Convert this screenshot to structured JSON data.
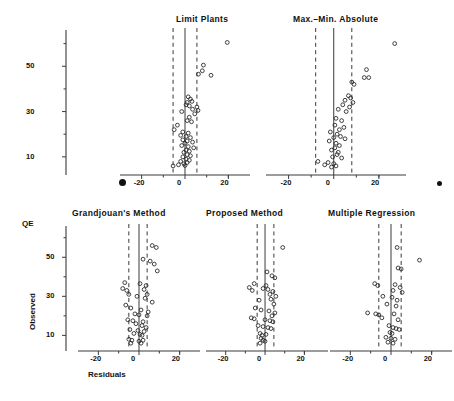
{
  "figure": {
    "axis_labels": {
      "y_top_line1": "QE",
      "y_rotated": "Observed",
      "x_label": "Residuals"
    },
    "y_axis_top": {
      "ticklabels": [
        "50",
        "30",
        "10"
      ],
      "tickvalues": [
        50,
        30,
        10
      ],
      "minor_ticks": [
        60,
        40,
        20
      ]
    },
    "y_axis_bottom": {
      "ticklabels": [
        "50",
        "30",
        "10"
      ],
      "tickvalues": [
        50,
        30,
        10
      ],
      "minor_ticks": [
        60,
        40,
        20
      ]
    },
    "marker_dot_left": "page-marker-dot",
    "marker_dot_right": "page-marker-dot"
  },
  "chart_data": [
    {
      "type": "scatter",
      "title": "Limit  Plants",
      "xlabel": "",
      "ylabel": "",
      "xlim": [
        -30,
        30
      ],
      "ylim": [
        2,
        66
      ],
      "xticks": [
        -20,
        0,
        20
      ],
      "xticklabels": [
        "-20",
        "0",
        "20"
      ],
      "grid": false,
      "reference_lines": {
        "solid": 0,
        "dashed": [
          -5.5,
          5.5
        ]
      },
      "points": [
        {
          "x": 19.5,
          "y": 60.5
        },
        {
          "x": 8.5,
          "y": 50.5
        },
        {
          "x": 8.0,
          "y": 48.0
        },
        {
          "x": 6.2,
          "y": 46.5
        },
        {
          "x": 12.0,
          "y": 46.0
        },
        {
          "x": 1.5,
          "y": 36.5
        },
        {
          "x": 2.5,
          "y": 35.5
        },
        {
          "x": 3.2,
          "y": 34.5
        },
        {
          "x": 1.0,
          "y": 34.0
        },
        {
          "x": 0.5,
          "y": 33.0
        },
        {
          "x": 2.0,
          "y": 32.5
        },
        {
          "x": 5.5,
          "y": 32.0
        },
        {
          "x": 3.5,
          "y": 31.0
        },
        {
          "x": 6.0,
          "y": 30.5
        },
        {
          "x": -1.5,
          "y": 30.0
        },
        {
          "x": 4.5,
          "y": 29.0
        },
        {
          "x": 2.0,
          "y": 27.5
        },
        {
          "x": 1.0,
          "y": 26.0
        },
        {
          "x": 3.0,
          "y": 25.5
        },
        {
          "x": -3.5,
          "y": 24.0
        },
        {
          "x": -5.0,
          "y": 22.0
        },
        {
          "x": -1.0,
          "y": 21.0
        },
        {
          "x": 1.5,
          "y": 20.5
        },
        {
          "x": -2.0,
          "y": 19.5
        },
        {
          "x": 0.5,
          "y": 19.0
        },
        {
          "x": 2.5,
          "y": 18.5
        },
        {
          "x": -1.0,
          "y": 17.5
        },
        {
          "x": 1.0,
          "y": 17.0
        },
        {
          "x": 3.5,
          "y": 16.5
        },
        {
          "x": 0.0,
          "y": 16.0
        },
        {
          "x": -1.5,
          "y": 15.0
        },
        {
          "x": 1.5,
          "y": 14.5
        },
        {
          "x": 4.0,
          "y": 14.0
        },
        {
          "x": 0.5,
          "y": 13.0
        },
        {
          "x": 2.0,
          "y": 12.5
        },
        {
          "x": -0.5,
          "y": 12.0
        },
        {
          "x": 1.0,
          "y": 11.0
        },
        {
          "x": 2.5,
          "y": 10.5
        },
        {
          "x": -1.0,
          "y": 10.0
        },
        {
          "x": 0.5,
          "y": 9.0
        },
        {
          "x": 2.0,
          "y": 8.5
        },
        {
          "x": -2.0,
          "y": 8.0
        },
        {
          "x": 1.0,
          "y": 7.5
        },
        {
          "x": -0.5,
          "y": 7.0
        },
        {
          "x": -5.5,
          "y": 6.0
        },
        {
          "x": -3.0,
          "y": 6.5
        },
        {
          "x": 0.0,
          "y": 6.2
        }
      ]
    },
    {
      "type": "scatter",
      "title": "Max.–Min. Absolute",
      "xlabel": "",
      "ylabel": "",
      "xlim": [
        -30,
        32
      ],
      "ylim": [
        2,
        66
      ],
      "xticks": [
        -20,
        0,
        20
      ],
      "xticklabels": [
        "-20",
        "0",
        "20"
      ],
      "grid": false,
      "reference_lines": {
        "solid": 0,
        "dashed": [
          -8.0,
          8.0
        ]
      },
      "points": [
        {
          "x": 27.0,
          "y": 60.0
        },
        {
          "x": 14.5,
          "y": 48.5
        },
        {
          "x": 13.5,
          "y": 45.0
        },
        {
          "x": 15.5,
          "y": 45.0
        },
        {
          "x": 8.0,
          "y": 43.0
        },
        {
          "x": 9.0,
          "y": 42.0
        },
        {
          "x": 6.5,
          "y": 37.0
        },
        {
          "x": 7.5,
          "y": 36.0
        },
        {
          "x": 5.0,
          "y": 35.0
        },
        {
          "x": 8.5,
          "y": 34.0
        },
        {
          "x": 4.0,
          "y": 33.0
        },
        {
          "x": 7.0,
          "y": 32.0
        },
        {
          "x": 2.0,
          "y": 31.0
        },
        {
          "x": 5.5,
          "y": 30.0
        },
        {
          "x": 1.0,
          "y": 27.0
        },
        {
          "x": 3.5,
          "y": 26.0
        },
        {
          "x": 0.5,
          "y": 24.0
        },
        {
          "x": 4.5,
          "y": 23.0
        },
        {
          "x": 2.5,
          "y": 22.0
        },
        {
          "x": -1.5,
          "y": 21.0
        },
        {
          "x": 1.5,
          "y": 20.0
        },
        {
          "x": 3.0,
          "y": 19.0
        },
        {
          "x": 0.0,
          "y": 18.5
        },
        {
          "x": 5.0,
          "y": 18.0
        },
        {
          "x": -2.0,
          "y": 17.0
        },
        {
          "x": 1.0,
          "y": 16.0
        },
        {
          "x": 2.5,
          "y": 15.0
        },
        {
          "x": 0.5,
          "y": 14.0
        },
        {
          "x": -1.0,
          "y": 13.0
        },
        {
          "x": 2.0,
          "y": 12.0
        },
        {
          "x": 1.5,
          "y": 11.0
        },
        {
          "x": -0.5,
          "y": 10.0
        },
        {
          "x": 3.5,
          "y": 9.5
        },
        {
          "x": -7.0,
          "y": 8.0
        },
        {
          "x": -2.5,
          "y": 7.5
        },
        {
          "x": 0.0,
          "y": 7.0
        },
        {
          "x": -4.0,
          "y": 6.5
        },
        {
          "x": 1.0,
          "y": 6.0
        },
        {
          "x": -1.0,
          "y": 5.5
        }
      ]
    },
    {
      "type": "scatter",
      "title": "Grandjouan's  Method",
      "xlabel": "Residuals",
      "ylabel": "QE Observed",
      "xlim": [
        -30,
        30
      ],
      "ylim": [
        2,
        66
      ],
      "xticks": [
        -20,
        0,
        20
      ],
      "xticklabels": [
        "-20",
        "0",
        "20"
      ],
      "grid": false,
      "reference_lines": {
        "solid": 0,
        "dashed": [
          -5.0,
          4.0
        ]
      },
      "points": [
        {
          "x": 6.5,
          "y": 56.0
        },
        {
          "x": 8.5,
          "y": 55.0
        },
        {
          "x": 2.0,
          "y": 49.0
        },
        {
          "x": 5.5,
          "y": 48.0
        },
        {
          "x": 7.5,
          "y": 46.5
        },
        {
          "x": 9.0,
          "y": 43.0
        },
        {
          "x": -7.0,
          "y": 37.0
        },
        {
          "x": 0.5,
          "y": 36.5
        },
        {
          "x": 3.5,
          "y": 35.5
        },
        {
          "x": -8.0,
          "y": 34.0
        },
        {
          "x": -6.0,
          "y": 33.0
        },
        {
          "x": 2.5,
          "y": 33.5
        },
        {
          "x": -5.0,
          "y": 31.0
        },
        {
          "x": 4.0,
          "y": 31.0
        },
        {
          "x": -1.0,
          "y": 30.0
        },
        {
          "x": 3.0,
          "y": 29.0
        },
        {
          "x": 6.5,
          "y": 27.0
        },
        {
          "x": -6.5,
          "y": 25.5
        },
        {
          "x": -4.0,
          "y": 24.0
        },
        {
          "x": 1.0,
          "y": 23.0
        },
        {
          "x": 4.5,
          "y": 22.0
        },
        {
          "x": -2.0,
          "y": 21.0
        },
        {
          "x": 0.0,
          "y": 20.5
        },
        {
          "x": 4.0,
          "y": 20.0
        },
        {
          "x": -5.5,
          "y": 18.0
        },
        {
          "x": -3.0,
          "y": 17.5
        },
        {
          "x": 2.0,
          "y": 17.0
        },
        {
          "x": -1.5,
          "y": 16.0
        },
        {
          "x": 1.5,
          "y": 15.0
        },
        {
          "x": 3.5,
          "y": 14.0
        },
        {
          "x": -4.5,
          "y": 13.0
        },
        {
          "x": -0.5,
          "y": 12.5
        },
        {
          "x": 2.5,
          "y": 12.0
        },
        {
          "x": -2.5,
          "y": 11.0
        },
        {
          "x": 0.5,
          "y": 10.5
        },
        {
          "x": 1.5,
          "y": 10.0
        },
        {
          "x": -5.0,
          "y": 8.0
        },
        {
          "x": -3.5,
          "y": 7.5
        },
        {
          "x": 0.0,
          "y": 7.0
        },
        {
          "x": 2.0,
          "y": 7.5
        },
        {
          "x": -4.0,
          "y": 6.0
        },
        {
          "x": 1.0,
          "y": 6.0
        }
      ]
    },
    {
      "type": "scatter",
      "title": "Proposed  Method",
      "xlabel": "",
      "ylabel": "",
      "xlim": [
        -30,
        32
      ],
      "ylim": [
        2,
        66
      ],
      "xticks": [
        -20,
        0,
        20
      ],
      "xticklabels": [
        "-20",
        "0",
        "20"
      ],
      "grid": false,
      "reference_lines": {
        "solid": 0,
        "dashed": [
          -4.0,
          4.5
        ]
      },
      "points": [
        {
          "x": 9.0,
          "y": 55.0
        },
        {
          "x": 1.0,
          "y": 42.5
        },
        {
          "x": 3.5,
          "y": 40.5
        },
        {
          "x": 5.0,
          "y": 39.5
        },
        {
          "x": -5.5,
          "y": 36.5
        },
        {
          "x": 0.5,
          "y": 35.5
        },
        {
          "x": -8.0,
          "y": 34.5
        },
        {
          "x": -6.5,
          "y": 33.0
        },
        {
          "x": -1.0,
          "y": 34.0
        },
        {
          "x": 1.5,
          "y": 33.5
        },
        {
          "x": 4.0,
          "y": 32.5
        },
        {
          "x": 2.5,
          "y": 31.0
        },
        {
          "x": 5.5,
          "y": 30.0
        },
        {
          "x": -3.0,
          "y": 28.0
        },
        {
          "x": 3.0,
          "y": 28.5
        },
        {
          "x": 4.5,
          "y": 26.0
        },
        {
          "x": -5.0,
          "y": 24.0
        },
        {
          "x": -2.0,
          "y": 23.0
        },
        {
          "x": 2.0,
          "y": 22.5
        },
        {
          "x": 5.0,
          "y": 21.5
        },
        {
          "x": 3.5,
          "y": 20.0
        },
        {
          "x": -7.0,
          "y": 19.0
        },
        {
          "x": -5.5,
          "y": 18.5
        },
        {
          "x": 0.0,
          "y": 18.0
        },
        {
          "x": 2.5,
          "y": 17.5
        },
        {
          "x": 4.0,
          "y": 17.0
        },
        {
          "x": -3.5,
          "y": 15.0
        },
        {
          "x": -1.0,
          "y": 14.5
        },
        {
          "x": 1.5,
          "y": 14.0
        },
        {
          "x": 3.0,
          "y": 13.5
        },
        {
          "x": -2.5,
          "y": 11.0
        },
        {
          "x": -1.5,
          "y": 10.0
        },
        {
          "x": 0.5,
          "y": 10.5
        },
        {
          "x": -2.0,
          "y": 8.5
        },
        {
          "x": -1.0,
          "y": 7.5
        },
        {
          "x": 0.0,
          "y": 7.0
        },
        {
          "x": -2.5,
          "y": 6.0
        }
      ]
    },
    {
      "type": "scatter",
      "title": "Multiple  Regression",
      "xlabel": "",
      "ylabel": "",
      "xlim": [
        -30,
        30
      ],
      "ylim": [
        2,
        66
      ],
      "xticks": [
        -20,
        0,
        20
      ],
      "xticklabels": [
        "-20",
        "0",
        "20"
      ],
      "grid": false,
      "reference_lines": {
        "solid": 0,
        "dashed": [
          -6.0,
          5.0
        ]
      },
      "points": [
        {
          "x": 3.0,
          "y": 55.0
        },
        {
          "x": 14.0,
          "y": 48.5
        },
        {
          "x": 3.5,
          "y": 44.5
        },
        {
          "x": 5.0,
          "y": 44.0
        },
        {
          "x": -8.0,
          "y": 36.5
        },
        {
          "x": -6.5,
          "y": 35.5
        },
        {
          "x": 2.0,
          "y": 36.0
        },
        {
          "x": 4.5,
          "y": 34.5
        },
        {
          "x": 1.0,
          "y": 33.0
        },
        {
          "x": 5.5,
          "y": 32.0
        },
        {
          "x": -4.0,
          "y": 30.0
        },
        {
          "x": 0.5,
          "y": 29.5
        },
        {
          "x": 3.0,
          "y": 28.0
        },
        {
          "x": -2.0,
          "y": 26.0
        },
        {
          "x": 2.5,
          "y": 25.0
        },
        {
          "x": -11.5,
          "y": 21.5
        },
        {
          "x": -7.5,
          "y": 21.0
        },
        {
          "x": -6.0,
          "y": 20.5
        },
        {
          "x": 1.5,
          "y": 21.0
        },
        {
          "x": -4.5,
          "y": 19.0
        },
        {
          "x": 3.5,
          "y": 18.0
        },
        {
          "x": -1.0,
          "y": 15.0
        },
        {
          "x": 1.0,
          "y": 14.0
        },
        {
          "x": 2.5,
          "y": 13.5
        },
        {
          "x": 4.0,
          "y": 13.0
        },
        {
          "x": -0.5,
          "y": 11.5
        },
        {
          "x": 0.5,
          "y": 11.0
        },
        {
          "x": -2.5,
          "y": 9.0
        },
        {
          "x": 0.0,
          "y": 8.5
        },
        {
          "x": 2.0,
          "y": 8.0
        },
        {
          "x": -1.5,
          "y": 6.5
        },
        {
          "x": 1.0,
          "y": 6.0
        }
      ]
    }
  ]
}
